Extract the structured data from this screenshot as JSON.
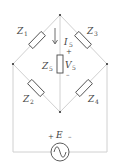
{
  "diagram": {
    "title": "",
    "type": "wheatstone-bridge",
    "components": [
      {
        "id": "Z1",
        "label": "Z",
        "sub": "1",
        "kind": "impedance",
        "branch": "top-left"
      },
      {
        "id": "Z2",
        "label": "Z",
        "sub": "2",
        "kind": "impedance",
        "branch": "bottom-left"
      },
      {
        "id": "Z3",
        "label": "Z",
        "sub": "3",
        "kind": "impedance",
        "branch": "top-right"
      },
      {
        "id": "Z4",
        "label": "Z",
        "sub": "4",
        "kind": "impedance",
        "branch": "bottom-right"
      },
      {
        "id": "Z5",
        "label": "Z",
        "sub": "5",
        "kind": "impedance",
        "branch": "center-vertical"
      },
      {
        "id": "E",
        "label": "E",
        "kind": "ac-source",
        "branch": "bottom"
      }
    ],
    "current": {
      "label": "I",
      "sub": "5",
      "direction": "down"
    },
    "voltage": {
      "label": "V",
      "sub": "5",
      "plus": "+",
      "minus": "–"
    },
    "source": {
      "label": "E",
      "plus": "+",
      "minus": "–"
    }
  }
}
